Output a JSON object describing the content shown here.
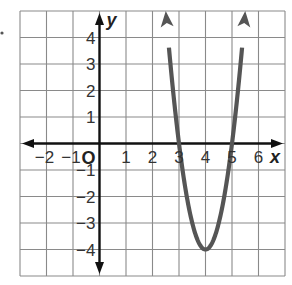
{
  "chart_data": {
    "type": "line",
    "title": "",
    "xlabel": "x",
    "ylabel": "y",
    "origin_label": "O",
    "xlim": [
      -3,
      7
    ],
    "ylim": [
      -5,
      5
    ],
    "grid": true,
    "x_ticks": [
      -2,
      -1,
      1,
      2,
      3,
      4,
      5,
      6
    ],
    "x_tick_labels": [
      "−2",
      "−1",
      "1",
      "2",
      "3",
      "4",
      "5",
      "6"
    ],
    "y_ticks": [
      4,
      3,
      2,
      1,
      -1,
      -2,
      -3,
      -4
    ],
    "y_tick_labels": [
      "4",
      "3",
      "2",
      "1",
      "−1",
      "−2",
      "−3",
      "−4"
    ],
    "series": [
      {
        "name": "parabola",
        "equation": "y = 4(x − 3)(x − 5)",
        "vertex": [
          4,
          -4
        ],
        "x_intercepts": [
          3,
          5
        ],
        "domain_shown": [
          2.5,
          5.5
        ],
        "arrows_at_ends": true,
        "x": [
          2.5,
          3,
          3.5,
          4,
          4.5,
          5,
          5.5
        ],
        "values": [
          5,
          0,
          -3,
          -4,
          -3,
          0,
          5
        ]
      }
    ],
    "legend": null
  },
  "colors": {
    "grid": "#8a8a8a",
    "axis": "#111111",
    "curve": "#555555",
    "background": "#ffffff"
  },
  "layout": {
    "origin_px": [
      99.5,
      143.5
    ],
    "unit_px": 26.5
  }
}
